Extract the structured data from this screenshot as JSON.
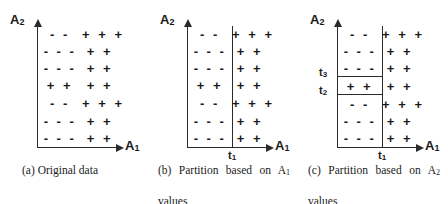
{
  "figure": {
    "background_color": "#ffffff",
    "ink_color": "#1a1a1a"
  },
  "symbols": {
    "positive": "+",
    "negative": "-"
  },
  "panels": [
    {
      "id": "a",
      "caption_label": "(a)",
      "caption_text": "Original data",
      "caption_line1": "(a)  Original data",
      "caption_line2": "",
      "axis_x_label": "A",
      "axis_x_sub": "1",
      "axis_y_label": "A",
      "axis_y_sub": "2",
      "has_vertical_split": false,
      "has_horizontal_splits": false,
      "thresholds": [],
      "rows": [
        {
          "left": "- -",
          "right": "+ + +"
        },
        {
          "left": "- - -",
          "right": "+ +"
        },
        {
          "left": "- - -",
          "right": "+ +"
        },
        {
          "left": "+ +",
          "right": "+ +"
        },
        {
          "left": "- -",
          "right": "+ + +"
        },
        {
          "left": "- - -",
          "right": "+ +"
        },
        {
          "left": "- - -",
          "right": "+ +"
        }
      ]
    },
    {
      "id": "b",
      "caption_label": "(b)",
      "caption_text": "Partition based on A1 values",
      "caption_line1": "(b)  Partition  based  on  A",
      "caption_line1_sub": "1",
      "caption_line2": "values",
      "axis_x_label": "A",
      "axis_x_sub": "1",
      "axis_y_label": "A",
      "axis_y_sub": "2",
      "has_vertical_split": true,
      "has_horizontal_splits": false,
      "thresholds": [
        {
          "name": "t",
          "sub": "1",
          "orientation": "vertical"
        }
      ],
      "rows": [
        {
          "left": "- -",
          "right": "+ + +"
        },
        {
          "left": "- - -",
          "right": "+ +"
        },
        {
          "left": "- - -",
          "right": "+ +"
        },
        {
          "left": "+ +",
          "right": "+ +"
        },
        {
          "left": "- -",
          "right": "+ + +"
        },
        {
          "left": "- - -",
          "right": "+ +"
        },
        {
          "left": "- - -",
          "right": "+ +"
        }
      ]
    },
    {
      "id": "c",
      "caption_label": "(c)",
      "caption_text": "Partition based on A2 values",
      "caption_line1": "(c)  Partition  based  on  A",
      "caption_line1_sub": "2",
      "caption_line2": "values",
      "axis_x_label": "A",
      "axis_x_sub": "1",
      "axis_y_label": "A",
      "axis_y_sub": "2",
      "has_vertical_split": true,
      "has_horizontal_splits": true,
      "thresholds": [
        {
          "name": "t",
          "sub": "1",
          "orientation": "vertical"
        },
        {
          "name": "t",
          "sub": "3",
          "orientation": "horizontal",
          "above_row": 4
        },
        {
          "name": "t",
          "sub": "2",
          "orientation": "horizontal",
          "below_row": 4
        }
      ],
      "rows": [
        {
          "left": "- -",
          "right": "+ + +"
        },
        {
          "left": "- - -",
          "right": "+ +"
        },
        {
          "left": "- - -",
          "right": "+ +"
        },
        {
          "left": "+ +",
          "right": "+ +"
        },
        {
          "left": "- -",
          "right": "+ + +"
        },
        {
          "left": "- - -",
          "right": "+ +"
        },
        {
          "left": "- - -",
          "right": "+ +"
        }
      ]
    }
  ]
}
